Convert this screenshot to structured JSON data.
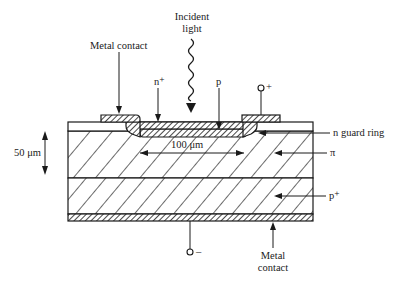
{
  "diagram": {
    "type": "cross-section",
    "labels": {
      "incident_light_1": "Incident",
      "incident_light_2": "light",
      "metal_contact_top": "Metal contact",
      "n_plus": "n⁺",
      "p": "p",
      "plus_terminal": "+",
      "minus_terminal": "–",
      "n_guard_ring": "n guard ring",
      "width": "100 μm",
      "thickness": "50 μm",
      "pi": "π",
      "p_plus": "p⁺",
      "metal_contact_bottom_1": "Metal",
      "metal_contact_bottom_2": "contact"
    },
    "colors": {
      "line": "#1a1a1a",
      "background": "#ffffff"
    }
  }
}
